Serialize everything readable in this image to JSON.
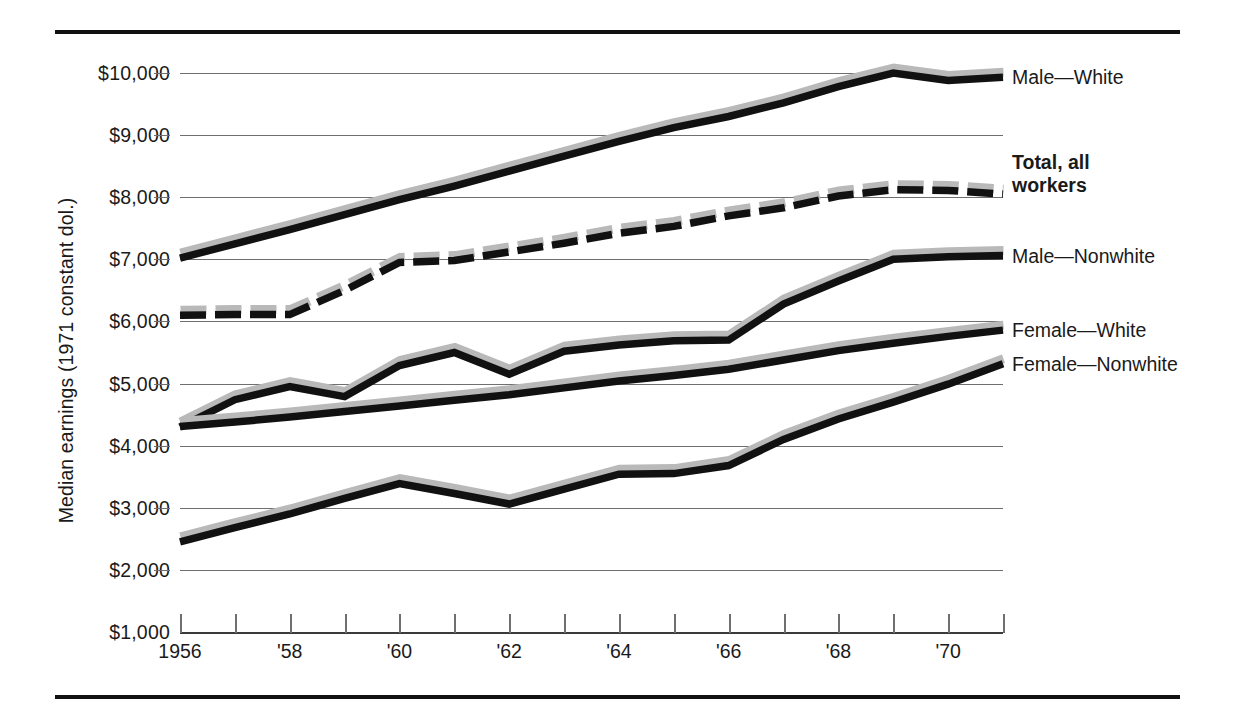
{
  "chart_data": {
    "type": "line",
    "title": "",
    "xlabel": "",
    "ylabel": "Median earnings (1971 constant dol.)",
    "grid": true,
    "legend_position": "right-of-plot-at-series-end",
    "ylim": [
      1000,
      10000
    ],
    "ytick_labels": [
      "$10,000",
      "$9,000",
      "$8,000",
      "$7,000",
      "$6,000",
      "$5,000",
      "$4,000",
      "$3,000",
      "$2,000",
      "$1,000"
    ],
    "ytick_values": [
      10000,
      9000,
      8000,
      7000,
      6000,
      5000,
      4000,
      3000,
      2000,
      1000
    ],
    "xlim": [
      1956,
      1971
    ],
    "x": [
      1956,
      1957,
      1958,
      1959,
      1960,
      1961,
      1962,
      1963,
      1964,
      1965,
      1966,
      1967,
      1968,
      1969,
      1970,
      1971
    ],
    "xtick_values": [
      1956,
      1957,
      1958,
      1959,
      1960,
      1961,
      1962,
      1963,
      1964,
      1965,
      1966,
      1967,
      1968,
      1969,
      1970,
      1971
    ],
    "xtick_labels": [
      "1956",
      "",
      "'58",
      "",
      "'60",
      "",
      "'62",
      "",
      "'64",
      "",
      "'66",
      "",
      "'68",
      "",
      "'70",
      ""
    ],
    "series": [
      {
        "name": "Male—White",
        "style": "solid",
        "values": [
          7020,
          7250,
          7480,
          7720,
          7960,
          8180,
          8420,
          8660,
          8900,
          9120,
          9300,
          9520,
          9780,
          10000,
          9880,
          9930
        ]
      },
      {
        "name": "Total, all workers",
        "style": "dashed",
        "bold_label": true,
        "values": [
          6100,
          6110,
          6110,
          6500,
          6950,
          6980,
          7120,
          7260,
          7420,
          7530,
          7700,
          7830,
          8020,
          8120,
          8110,
          8050
        ]
      },
      {
        "name": "Male—Nonwhite",
        "style": "solid",
        "values": [
          4300,
          4740,
          4950,
          4790,
          5290,
          5500,
          5150,
          5520,
          5620,
          5690,
          5700,
          6280,
          6650,
          7000,
          7040,
          7060
        ]
      },
      {
        "name": "Female—White",
        "style": "solid",
        "values": [
          4310,
          4380,
          4460,
          4550,
          4640,
          4730,
          4820,
          4930,
          5040,
          5130,
          5230,
          5380,
          5530,
          5650,
          5760,
          5860
        ]
      },
      {
        "name": "Female—Nonwhite",
        "style": "solid",
        "values": [
          2450,
          2680,
          2900,
          3150,
          3390,
          3230,
          3060,
          3300,
          3540,
          3550,
          3680,
          4100,
          4430,
          4700,
          4990,
          5320
        ]
      }
    ]
  },
  "axis": {
    "y_title": "Median earnings (1971 constant dol.)"
  },
  "legend": [
    {
      "label": "Male—White",
      "bold": false
    },
    {
      "label": "Total, all\nworkers",
      "bold": true
    },
    {
      "label": "Male—Nonwhite",
      "bold": false
    },
    {
      "label": "Female—White",
      "bold": false
    },
    {
      "label": "Female—Nonwhite",
      "bold": false
    }
  ],
  "colors": {
    "line": "#111111",
    "shadow": "#b9b9b9",
    "grid": "#6f6f6f",
    "rule": "#111111",
    "text": "#1a1a1a",
    "background": "#ffffff"
  }
}
